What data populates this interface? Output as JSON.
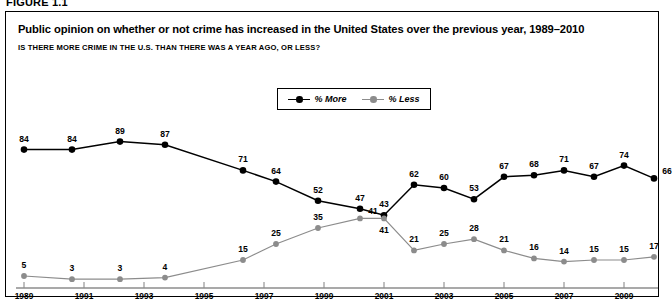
{
  "figure": {
    "label": "FIGURE 1.1"
  },
  "header": {
    "title": "Public opinion on whether or not crime has increased in the United States over the previous year, 1989–2010",
    "subtitle": "IS THERE MORE CRIME IN THE U.S. THAN THERE WAS A YEAR AGO, OR LESS?"
  },
  "legend": {
    "position": "top-center",
    "items": [
      {
        "label": "% More",
        "color": "#000000",
        "marker": "filled-circle"
      },
      {
        "label": "% Less",
        "color": "#8c8c8c",
        "marker": "filled-circle"
      }
    ]
  },
  "colors": {
    "more": "#000000",
    "less": "#8c8c8c",
    "axis": "#8c8c8c",
    "frame": "#000000",
    "background": "#ffffff"
  },
  "chart_data": {
    "type": "line",
    "title": "Public opinion on whether or not crime has increased in the United States over the previous year, 1989–2010",
    "subtitle": "IS THERE MORE CRIME IN THE U.S. THAN THERE WAS A YEAR AGO, OR LESS?",
    "xlabel": "",
    "ylabel": "",
    "ylim": [
      0,
      100
    ],
    "xlim": [
      1989,
      2010
    ],
    "grid": false,
    "legend_position": "top-center",
    "data_labels": true,
    "xticks": [
      "1989",
      "1991",
      "1993",
      "1995",
      "1997",
      "1999",
      "2001",
      "2003",
      "2005",
      "2007",
      "2009"
    ],
    "xtick_values": [
      1989,
      1991,
      1993,
      1995,
      1997,
      1999,
      2001,
      2003,
      2005,
      2007,
      2009
    ],
    "x": [
      1989.0,
      1990.6,
      1992.2,
      1993.7,
      1996.3,
      1997.4,
      1998.8,
      2000.2,
      2001.0,
      2002.0,
      2003.0,
      2004.0,
      2005.0,
      2006.0,
      2007.0,
      2008.0,
      2009.0,
      2010.0
    ],
    "series": [
      {
        "name": "% More",
        "color": "#000000",
        "values": [
          84,
          84,
          89,
          87,
          71,
          64,
          52,
          47,
          43,
          62,
          60,
          53,
          67,
          68,
          71,
          67,
          74,
          66
        ],
        "label_offsets": [
          "above",
          "above",
          "above",
          "above",
          "above",
          "above",
          "above",
          "above",
          "above",
          "above",
          "above",
          "above",
          "above",
          "above",
          "above",
          "above",
          "above",
          "right"
        ]
      },
      {
        "name": "% Less",
        "color": "#8c8c8c",
        "values": [
          5,
          3,
          3,
          4,
          15,
          25,
          35,
          41,
          41,
          21,
          25,
          28,
          21,
          16,
          14,
          15,
          15,
          17
        ],
        "label_offsets": [
          "above",
          "above",
          "above",
          "above",
          "above",
          "above",
          "above",
          "right",
          "below",
          "above",
          "above",
          "above",
          "above",
          "above",
          "above",
          "above",
          "above",
          "above"
        ]
      }
    ]
  }
}
